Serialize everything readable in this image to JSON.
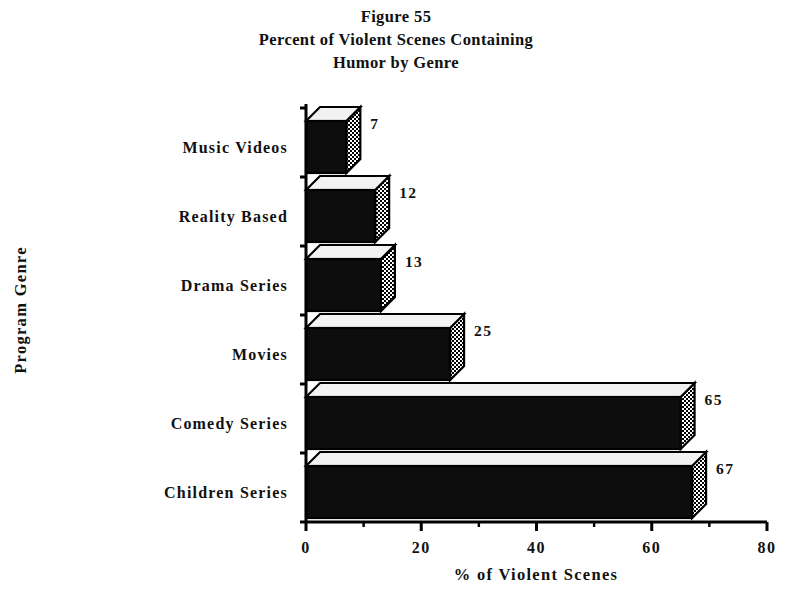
{
  "chart_data": {
    "type": "bar",
    "orientation": "horizontal",
    "title": "Figure 55\nPercent of Violent Scenes Containing\nHumor by Genre",
    "title_lines": [
      "Figure 55",
      "Percent of Violent Scenes Containing",
      "Humor by Genre"
    ],
    "figure_number": "Figure 55",
    "categories": [
      "Music Videos",
      "Reality Based",
      "Drama Series",
      "Movies",
      "Comedy Series",
      "Children Series"
    ],
    "values": [
      7,
      12,
      13,
      25,
      65,
      67
    ],
    "value_labels": [
      "7",
      "12",
      "13",
      "25",
      "65",
      "67"
    ],
    "xlabel": "% of Violent Scenes",
    "ylabel": "Program Genre",
    "xlim": [
      0,
      80
    ],
    "xticks": [
      0,
      20,
      40,
      60,
      80
    ],
    "xtick_labels": [
      "0",
      "20",
      "40",
      "60",
      "80"
    ],
    "xticks_minor": [
      10,
      30,
      50,
      70
    ],
    "grid": false,
    "legend": null,
    "style": {
      "bar_front_color": "#0d0d0d",
      "bar_top_color": "#f2f2f2",
      "bar_side_pattern": "checker",
      "bar_outline_color": "#000000",
      "axis_color": "#000000",
      "background": "#ffffff"
    }
  },
  "axes": {
    "x_axis_name": "% of Violent Scenes",
    "y_axis_name": "Program Genre"
  }
}
